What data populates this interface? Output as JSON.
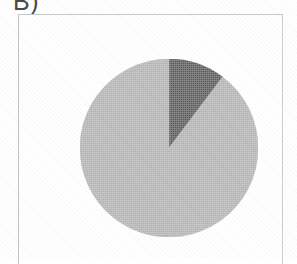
{
  "figure": {
    "panel_label": "B)",
    "frame_color": "#c9c9c9",
    "background_color": "#ffffff"
  },
  "chart_data": {
    "type": "pie",
    "title": "B)",
    "xlabel": "",
    "ylabel": "",
    "grid": false,
    "legend_position": "none",
    "start_angle_deg": 0,
    "direction": "clockwise",
    "center_px": [
      150,
      133
    ],
    "radius_px": 89,
    "categories": [
      "Major share",
      "Minor share"
    ],
    "values": [
      88,
      12
    ],
    "units": "percent",
    "colors": [
      "#b3b3b3",
      "#5a5a5a"
    ],
    "slices": [
      {
        "name": "Major share",
        "value": 88,
        "color": "#b3b3b3",
        "start_deg": 37,
        "end_deg": 360,
        "shade": "light gray"
      },
      {
        "name": "Minor share",
        "value": 12,
        "color": "#5a5a5a",
        "start_deg": 0,
        "end_deg": 37,
        "shade": "dark gray"
      }
    ],
    "annotations": []
  }
}
